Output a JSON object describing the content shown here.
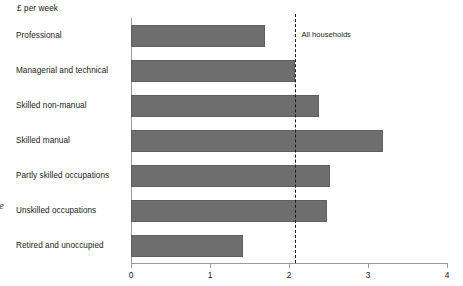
{
  "chart_data": {
    "type": "bar",
    "orientation": "horizontal",
    "title": "",
    "subtitle": "",
    "xlabel": "",
    "ylabel": "£ per week",
    "categories": [
      "Professional",
      "Managerial and technical",
      "Skilled non-manual",
      "Skilled manual",
      "Partly skilled occupations",
      "Unskilled occupations",
      "Retired and unoccupied"
    ],
    "values": [
      1.69,
      2.07,
      2.38,
      3.19,
      2.52,
      2.48,
      1.42
    ],
    "xlim": [
      0,
      4
    ],
    "xticks": [
      0,
      1,
      2,
      3,
      4
    ],
    "xtick_labels": [
      "0",
      "1",
      "2",
      "3",
      "4"
    ],
    "grid": false,
    "legend": "none",
    "bar_color": "#6e6e6e",
    "axis_color": "#9a9a9a",
    "annotations": [
      {
        "name": "all-households-reference-line",
        "label": "All households",
        "value": 2.07,
        "style": "dashed",
        "color": "#1a1a1a"
      }
    ]
  },
  "axis_title": "£ per week",
  "reference_label": "All households",
  "margin_glyph": "e"
}
